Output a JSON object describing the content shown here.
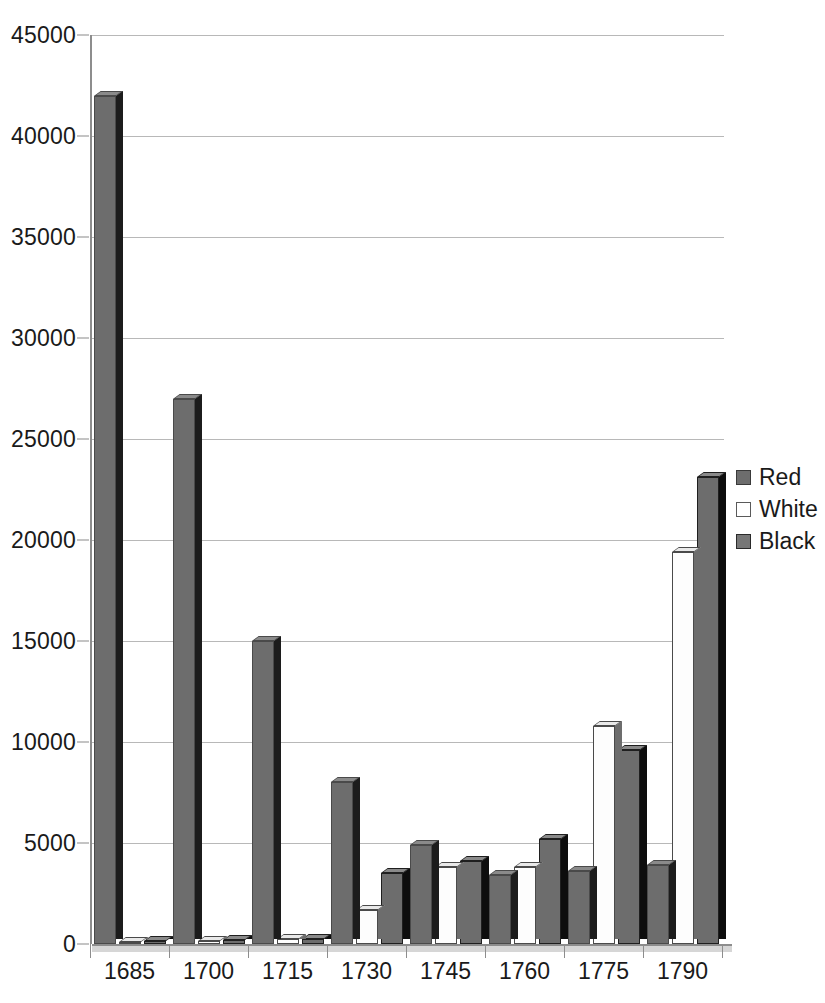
{
  "chart_data": {
    "type": "bar",
    "title": "",
    "subtitle": "",
    "xlabel": "",
    "ylabel": "",
    "ylim": [
      0,
      45000
    ],
    "ytick_step": 5000,
    "ytick_labels": [
      "0",
      "5000",
      "10000",
      "15000",
      "20000",
      "25000",
      "30000",
      "35000",
      "40000",
      "45000"
    ],
    "ytick_values": [
      0,
      5000,
      10000,
      15000,
      20000,
      25000,
      30000,
      35000,
      40000,
      45000
    ],
    "categories": [
      "1685",
      "1700",
      "1715",
      "1730",
      "1745",
      "1760",
      "1775",
      "1790"
    ],
    "grid": true,
    "grid_axis": "y",
    "legend_position": "right",
    "series": [
      {
        "name": "Red",
        "color": "#6d6d6d",
        "swatch": "red",
        "values": [
          42000,
          27000,
          15000,
          8000,
          4900,
          3400,
          3600,
          3900
        ]
      },
      {
        "name": "White",
        "color": "#ffffff",
        "swatch": "white",
        "values": [
          100,
          150,
          250,
          1700,
          3800,
          3800,
          10800,
          19400
        ]
      },
      {
        "name": "Black",
        "color": "#777777",
        "swatch": "black",
        "values": [
          150,
          200,
          250,
          3500,
          4100,
          5200,
          9600,
          23100
        ]
      }
    ]
  },
  "legend": {
    "items": [
      {
        "label": "Red",
        "swatch": "red"
      },
      {
        "label": "White",
        "swatch": "white"
      },
      {
        "label": "Black",
        "swatch": "black"
      }
    ]
  },
  "axes": {
    "y_axis_name": "value-axis",
    "x_axis_name": "year-axis"
  }
}
